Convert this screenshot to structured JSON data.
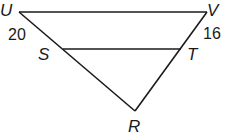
{
  "diagram": {
    "type": "triangle-with-parallel-segment",
    "stroke_color": "#1a1a1a",
    "vertices": {
      "U": {
        "label": "U",
        "x": 19,
        "y": 12
      },
      "V": {
        "label": "V",
        "x": 207,
        "y": 12
      },
      "S": {
        "label": "S",
        "x": 63,
        "y": 49
      },
      "T": {
        "label": "T",
        "x": 181,
        "y": 49
      },
      "R": {
        "label": "R",
        "x": 135,
        "y": 111
      }
    },
    "segments": [
      {
        "from": "U",
        "to": "V"
      },
      {
        "from": "U",
        "to": "R"
      },
      {
        "from": "V",
        "to": "R"
      },
      {
        "from": "S",
        "to": "T"
      }
    ],
    "measures": {
      "US": "20",
      "VT": "16"
    }
  }
}
